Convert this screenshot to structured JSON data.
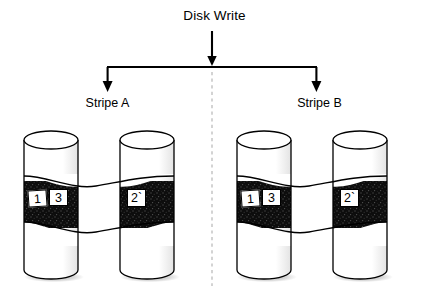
{
  "diagram": {
    "title": "Disk Write",
    "center_divider": "dashed-vertical-divider",
    "arrow_down_icon": "arrow-down-icon",
    "groups": [
      {
        "label": "Stripe A",
        "disks": [
          {
            "name": "disk-a1",
            "blocks": [
              "1",
              "3"
            ]
          },
          {
            "name": "disk-a2",
            "blocks": [
              "2`"
            ]
          }
        ]
      },
      {
        "label": "Stripe B",
        "disks": [
          {
            "name": "disk-b1",
            "blocks": [
              "1",
              "3"
            ]
          },
          {
            "name": "disk-b2",
            "blocks": [
              "2`"
            ]
          }
        ]
      }
    ],
    "colors": {
      "line": "#000000",
      "band": "#111111",
      "cylinder_fill": "#ffffff",
      "shadow": "#c9c9c9",
      "divider": "#b0b0b0"
    }
  }
}
